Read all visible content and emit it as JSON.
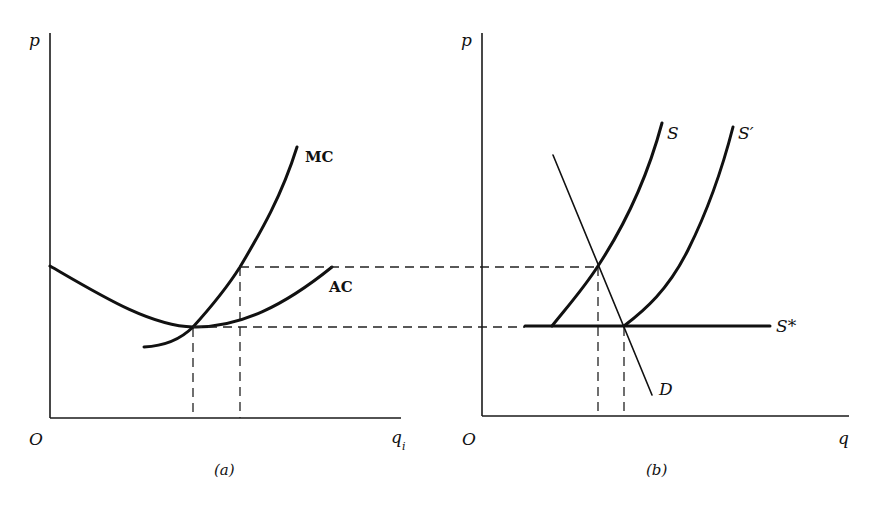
{
  "figure": {
    "type": "economics-diagram",
    "panels": [
      {
        "id": "a",
        "caption": "(a)",
        "y_axis_label": "p",
        "x_axis_label": "q",
        "x_axis_subscript": "i",
        "origin_label": "O",
        "curves": [
          {
            "name": "MC",
            "label": "MC",
            "style": "thick"
          },
          {
            "name": "AC",
            "label": "AC",
            "style": "thick"
          }
        ],
        "guides": [
          {
            "type": "dashed-horizontal",
            "at": "min AC (MC = AC)",
            "extends_to": "panel b"
          },
          {
            "type": "dashed-horizontal",
            "at": "higher price on MC",
            "extends_to": "panel b"
          },
          {
            "type": "dashed-vertical",
            "at": "q at min AC"
          },
          {
            "type": "dashed-vertical",
            "at": "q on MC at higher price"
          }
        ]
      },
      {
        "id": "b",
        "caption": "(b)",
        "y_axis_label": "p",
        "x_axis_label": "q",
        "origin_label": "O",
        "curves": [
          {
            "name": "S",
            "label": "S",
            "style": "thick"
          },
          {
            "name": "S_prime",
            "label": "S′",
            "style": "thick"
          },
          {
            "name": "S_star",
            "label": "S*",
            "style": "thick-horizontal"
          },
          {
            "name": "D",
            "label": "D",
            "style": "thin"
          }
        ],
        "guides": [
          {
            "type": "dashed-vertical",
            "at": "S ∩ D"
          },
          {
            "type": "dashed-vertical",
            "at": "S′ ∩ D ∩ S*"
          }
        ]
      }
    ]
  },
  "labels": {
    "a_p": "p",
    "a_origin": "O",
    "a_q": "q",
    "a_q_sub": "i",
    "a_mc": "MC",
    "a_ac": "AC",
    "a_caption": "(a)",
    "b_p": "p",
    "b_origin": "O",
    "b_q": "q",
    "b_s": "S",
    "b_s_prime": "S′",
    "b_s_star": "S*",
    "b_d": "D",
    "b_caption": "(b)"
  },
  "colors": {
    "ink": "#111111",
    "background": "#ffffff"
  }
}
